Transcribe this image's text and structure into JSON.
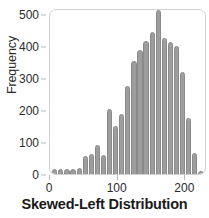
{
  "chart_data": {
    "type": "bar",
    "title": "Skewed-Left Distribution",
    "xlabel": "Skewed-Left Distribution",
    "ylabel": "Frequency",
    "grid": false,
    "legend": null,
    "xlim": [
      0,
      232
    ],
    "ylim": [
      0,
      520
    ],
    "xticks": [
      0,
      100,
      200
    ],
    "xtick_labels": [
      "0",
      "100",
      "200"
    ],
    "yticks": [
      0,
      100,
      200,
      300,
      400,
      500
    ],
    "ytick_labels": [
      "0",
      "100",
      "200",
      "300",
      "400",
      "500"
    ],
    "bar_color": "#9d9d9d",
    "bar_edge_color": "#8a8a8a",
    "bin_width": 9,
    "categories": [
      7,
      16,
      25,
      34,
      43,
      52,
      61,
      70,
      79,
      88,
      97,
      106,
      115,
      124,
      133,
      142,
      151,
      160,
      169,
      178,
      187,
      196,
      205,
      214,
      223
    ],
    "values": [
      6,
      6,
      6,
      6,
      8,
      48,
      52,
      80,
      50,
      195,
      140,
      178,
      265,
      345,
      380,
      408,
      437,
      505,
      417,
      403,
      392,
      310,
      165,
      55,
      0
    ],
    "series": [
      {
        "name": "Frequency",
        "values": [
          6,
          6,
          6,
          6,
          8,
          48,
          52,
          80,
          50,
          195,
          140,
          178,
          265,
          345,
          380,
          408,
          437,
          505,
          417,
          403,
          392,
          310,
          165,
          55,
          0
        ]
      }
    ]
  },
  "axes": {
    "y_label": "Frequency",
    "y_ticks": [
      "500",
      "400",
      "300",
      "200",
      "100",
      "0"
    ],
    "x_ticks": [
      "0",
      "100",
      "200"
    ]
  },
  "title": {
    "text": "Skewed-Left Distribution"
  },
  "colors": {
    "bar_fill": "#9d9d9d",
    "bar_edge": "#8a8a8a",
    "frame": "#d2d2d2",
    "text": "#2b2b2b",
    "title_text": "#1a1a1a"
  }
}
